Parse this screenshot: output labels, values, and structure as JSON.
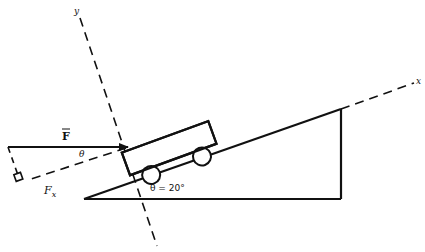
{
  "diagram": {
    "type": "physics-free-body",
    "labels": {
      "force": "F",
      "force_component": "F",
      "force_component_sub": "x",
      "angle_force": "θ",
      "angle_incline": "θ = 20°",
      "x_axis": "x",
      "y_axis": "y"
    },
    "incline_angle_deg": 20,
    "colors": {
      "stroke": "#111111",
      "background": "#ffffff"
    }
  }
}
